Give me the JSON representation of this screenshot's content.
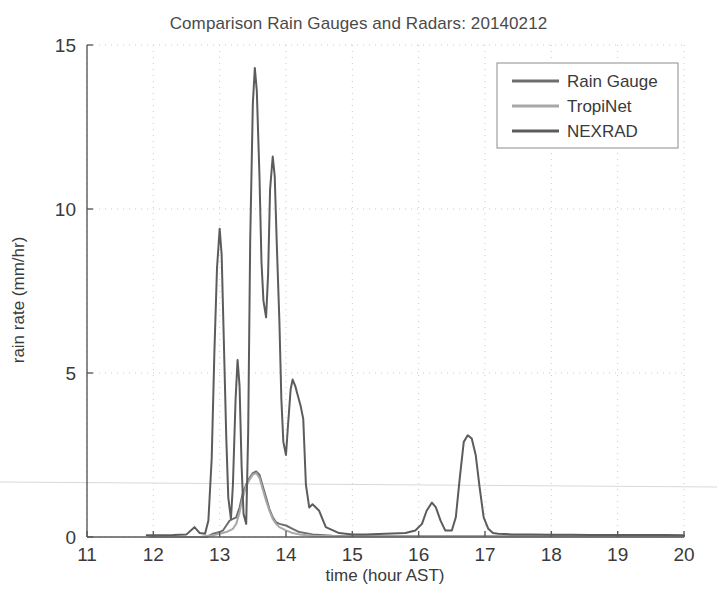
{
  "chart_data": {
    "type": "line",
    "title": "Comparison Rain Gauges and Radars: 20140212",
    "xlabel": "time (hour AST)",
    "ylabel": "rain rate (mm/hr)",
    "xlim": [
      11,
      20
    ],
    "ylim": [
      0,
      15
    ],
    "xticks": [
      11,
      12,
      13,
      14,
      15,
      16,
      17,
      18,
      19,
      20
    ],
    "yticks": [
      0,
      5,
      10,
      15
    ],
    "xtick_labels": [
      "11",
      "12",
      "13",
      "14",
      "15",
      "16",
      "17",
      "18",
      "19",
      "20"
    ],
    "ytick_labels": [
      "0",
      "5",
      "10",
      "15"
    ],
    "grid": true,
    "grid_style": "dotted",
    "legend_position": "top-right",
    "series": [
      {
        "name": "Rain Gauge",
        "color": "#6e6e6e",
        "x": [
          11.95,
          12.2,
          12.5,
          12.8,
          12.85,
          12.9,
          13.0,
          13.05,
          13.1,
          13.15,
          13.2,
          13.25,
          13.3,
          13.35,
          13.4,
          13.45,
          13.5,
          13.55,
          13.6,
          13.65,
          13.7,
          13.75,
          13.8,
          13.85,
          13.9,
          14.0,
          14.1,
          14.2,
          14.4,
          14.7,
          15.0,
          15.5,
          16.0,
          16.3,
          16.7,
          17.0,
          17.5,
          18.0,
          18.5,
          19.0,
          19.5,
          20.0
        ],
        "y": [
          0.0,
          0.0,
          0.0,
          0.0,
          0.05,
          0.1,
          0.15,
          0.2,
          0.35,
          0.5,
          0.55,
          0.6,
          0.9,
          1.35,
          1.6,
          1.8,
          1.95,
          2.0,
          1.9,
          1.55,
          1.2,
          0.85,
          0.6,
          0.45,
          0.4,
          0.35,
          0.25,
          0.15,
          0.08,
          0.04,
          0.02,
          0.02,
          0.02,
          0.02,
          0.02,
          0.02,
          0.02,
          0.02,
          0.02,
          0.02,
          0.02,
          0.02
        ]
      },
      {
        "name": "TropiNet",
        "color": "#a8a8a8",
        "x": [
          11.95,
          12.3,
          12.7,
          12.9,
          13.0,
          13.1,
          13.2,
          13.25,
          13.3,
          13.35,
          13.4,
          13.45,
          13.5,
          13.55,
          13.6,
          13.65,
          13.7,
          13.75,
          13.8,
          13.85,
          13.9,
          14.0,
          14.1,
          14.2,
          14.4,
          14.8,
          15.2,
          15.8,
          16.2,
          16.7,
          17.2,
          17.8,
          18.4,
          19.0,
          19.6,
          20.0
        ],
        "y": [
          0.0,
          0.0,
          0.0,
          0.05,
          0.1,
          0.15,
          0.25,
          0.4,
          0.75,
          1.2,
          1.55,
          1.75,
          1.9,
          1.95,
          1.8,
          1.45,
          1.1,
          0.8,
          0.55,
          0.4,
          0.3,
          0.2,
          0.12,
          0.08,
          0.04,
          0.02,
          0.02,
          0.02,
          0.02,
          0.02,
          0.02,
          0.02,
          0.02,
          0.02,
          0.02,
          0.02
        ]
      },
      {
        "name": "NEXRAD",
        "color": "#5c5c5c",
        "x": [
          11.9,
          12.1,
          12.3,
          12.5,
          12.62,
          12.7,
          12.78,
          12.83,
          12.88,
          12.92,
          12.96,
          13.0,
          13.03,
          13.06,
          13.1,
          13.13,
          13.17,
          13.2,
          13.24,
          13.27,
          13.3,
          13.33,
          13.36,
          13.4,
          13.43,
          13.46,
          13.5,
          13.53,
          13.56,
          13.6,
          13.63,
          13.66,
          13.7,
          13.73,
          13.76,
          13.8,
          13.83,
          13.86,
          13.9,
          13.93,
          13.96,
          14.0,
          14.03,
          14.07,
          14.1,
          14.14,
          14.18,
          14.22,
          14.26,
          14.3,
          14.35,
          14.4,
          14.5,
          14.6,
          14.8,
          15.0,
          15.2,
          15.5,
          15.8,
          15.95,
          16.05,
          16.12,
          16.2,
          16.26,
          16.33,
          16.4,
          16.5,
          16.56,
          16.62,
          16.68,
          16.74,
          16.8,
          16.86,
          16.92,
          16.98,
          17.05,
          17.12,
          17.2,
          17.4,
          17.7,
          18.0,
          18.3,
          18.6,
          19.0,
          19.4,
          19.7,
          20.0
        ],
        "y": [
          0.05,
          0.05,
          0.06,
          0.08,
          0.3,
          0.12,
          0.1,
          0.5,
          2.4,
          5.6,
          8.2,
          9.4,
          8.6,
          6.2,
          3.0,
          1.2,
          0.55,
          1.6,
          4.2,
          5.4,
          4.6,
          2.2,
          0.7,
          0.4,
          3.2,
          9.0,
          13.2,
          14.3,
          13.6,
          11.0,
          8.4,
          7.2,
          6.7,
          8.0,
          10.6,
          11.6,
          11.0,
          9.0,
          6.6,
          4.2,
          2.9,
          2.5,
          3.4,
          4.5,
          4.8,
          4.6,
          4.3,
          4.0,
          3.6,
          1.6,
          0.9,
          1.0,
          0.8,
          0.3,
          0.12,
          0.08,
          0.08,
          0.1,
          0.12,
          0.2,
          0.4,
          0.8,
          1.05,
          0.9,
          0.5,
          0.2,
          0.2,
          0.6,
          1.8,
          2.9,
          3.1,
          3.0,
          2.5,
          1.5,
          0.6,
          0.25,
          0.12,
          0.1,
          0.08,
          0.08,
          0.07,
          0.07,
          0.06,
          0.06,
          0.06,
          0.06,
          0.05
        ]
      }
    ]
  },
  "legend": {
    "entries": [
      "Rain Gauge",
      "TropiNet",
      "NEXRAD"
    ]
  }
}
